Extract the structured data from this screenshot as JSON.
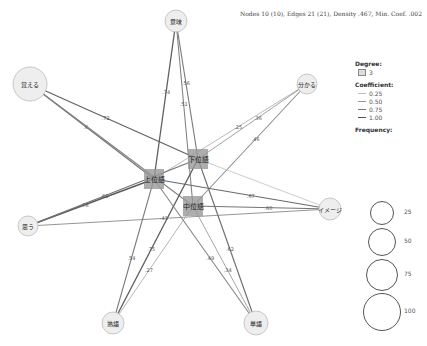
{
  "stats": "Nodes 10 (10), Edges 21 (21), Density .467, Min. Coef. .002",
  "nodes": [
    {
      "id": "oboeru",
      "label": "覚える",
      "x": 30,
      "y": 84,
      "r": 17,
      "type": "word"
    },
    {
      "id": "imi",
      "label": "意味",
      "x": 176,
      "y": 21,
      "r": 11,
      "type": "word"
    },
    {
      "id": "wakaru",
      "label": "分かる",
      "x": 307,
      "y": 84,
      "r": 10,
      "type": "word"
    },
    {
      "id": "omou",
      "label": "思う",
      "x": 28,
      "y": 226,
      "r": 10,
      "type": "word"
    },
    {
      "id": "image",
      "label": "イメージ",
      "x": 330,
      "y": 209,
      "r": 11,
      "type": "word"
    },
    {
      "id": "jukugo",
      "label": "熟語",
      "x": 113,
      "y": 323,
      "r": 11,
      "type": "word"
    },
    {
      "id": "tango",
      "label": "単語",
      "x": 256,
      "y": 323,
      "r": 12,
      "type": "word"
    },
    {
      "id": "joui",
      "label": "上位語",
      "x": 154,
      "y": 179,
      "w": 20,
      "h": 20,
      "type": "code"
    },
    {
      "id": "kai",
      "label": "下位語",
      "x": 198,
      "y": 159,
      "w": 20,
      "h": 20,
      "type": "code"
    },
    {
      "id": "chuui",
      "label": "中位語",
      "x": 193,
      "y": 206,
      "w": 20,
      "h": 20,
      "type": "code"
    }
  ],
  "edges": [
    {
      "from": "oboeru",
      "to": "kai",
      "label": ".72",
      "coef": 0.72
    },
    {
      "from": "oboeru",
      "to": "joui",
      "label": ".6",
      "coef": 0.6
    },
    {
      "from": "oboeru",
      "to": "chuui",
      "label": "",
      "coef": 0.5
    },
    {
      "from": "imi",
      "to": "joui",
      "label": ".74",
      "coef": 0.74
    },
    {
      "from": "imi",
      "to": "kai",
      "label": ".56",
      "coef": 0.56
    },
    {
      "from": "imi",
      "to": "chuui",
      "label": ".51",
      "coef": 0.51
    },
    {
      "from": "wakaru",
      "to": "joui",
      "label": ".25",
      "coef": 0.25
    },
    {
      "from": "wakaru",
      "to": "kai",
      "label": ".36",
      "coef": 0.36
    },
    {
      "from": "wakaru",
      "to": "chuui",
      "label": ".46",
      "coef": 0.46
    },
    {
      "from": "omou",
      "to": "joui",
      "label": ".78",
      "coef": 0.78
    },
    {
      "from": "omou",
      "to": "kai",
      "label": ".61",
      "coef": 0.61
    },
    {
      "from": "omou",
      "to": "image",
      "label": ".41",
      "coef": 0.41
    },
    {
      "from": "image",
      "to": "joui",
      "label": ".67",
      "coef": 0.67
    },
    {
      "from": "image",
      "to": "kai",
      "label": "",
      "coef": 0.15
    },
    {
      "from": "image",
      "to": "chuui",
      "label": ".60",
      "coef": 0.6
    },
    {
      "from": "jukugo",
      "to": "joui",
      "label": ".54",
      "coef": 0.54
    },
    {
      "from": "jukugo",
      "to": "kai",
      "label": ".75",
      "coef": 0.75
    },
    {
      "from": "jukugo",
      "to": "chuui",
      "label": ".27",
      "coef": 0.27
    },
    {
      "from": "tango",
      "to": "joui",
      "label": ".49",
      "coef": 0.49
    },
    {
      "from": "tango",
      "to": "kai",
      "label": ".62",
      "coef": 0.62
    },
    {
      "from": "tango",
      "to": "chuui",
      "label": ".34",
      "coef": 0.34
    }
  ],
  "legend": {
    "degree_title": "Degree:",
    "degree_value": "3",
    "coefficient_title": "Coefficient:",
    "coefficients": [
      {
        "label": "0.25",
        "width": 0.6,
        "color": "#bbbbbb"
      },
      {
        "label": "0.50",
        "width": 0.9,
        "color": "#999999"
      },
      {
        "label": "0.75",
        "width": 1.2,
        "color": "#777777"
      },
      {
        "label": "1.00",
        "width": 1.6,
        "color": "#555555"
      }
    ],
    "frequency_title": "Frequency:",
    "frequencies": [
      {
        "label": "25",
        "r": 11
      },
      {
        "label": "50",
        "r": 13
      },
      {
        "label": "75",
        "r": 15
      },
      {
        "label": "100",
        "r": 18
      }
    ]
  }
}
